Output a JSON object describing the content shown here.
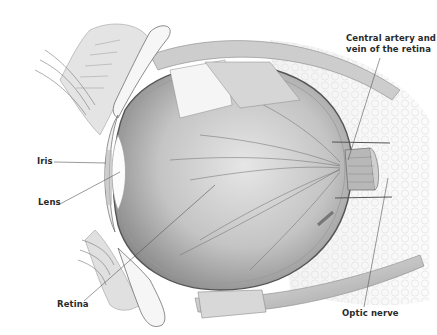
{
  "diagram": {
    "labels": {
      "central_artery": "Central artery and vein of the retina",
      "central_artery_line1": "Central artery and",
      "central_artery_line2": "vein of the retina",
      "iris": "Iris",
      "lens": "Lens",
      "retina": "Retina",
      "optic_nerve": "Optic nerve"
    },
    "colors": {
      "background": "#ffffff",
      "label_text": "#2a2a2a",
      "leader_line": "#555555",
      "eyeball_fill": "#cfcfcf",
      "tissue_light": "#ececec",
      "tissue_mid": "#b5b5b5",
      "tissue_dark": "#7a7a7a"
    }
  }
}
